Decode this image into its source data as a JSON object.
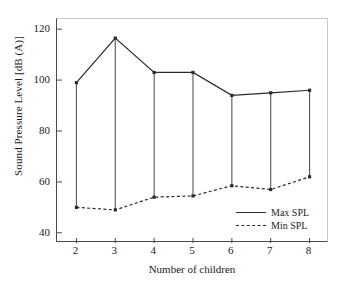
{
  "chart_data": {
    "type": "line",
    "title": "",
    "xlabel": "Number of children",
    "ylabel": "Sound Pressure Level [dB (A)]",
    "x": [
      2,
      3,
      4,
      5,
      6,
      7,
      8
    ],
    "xtick_labels": [
      "2",
      "3",
      "4",
      "5",
      "6",
      "7",
      "8"
    ],
    "ytick_labels": [
      "40",
      "60",
      "80",
      "100",
      "120"
    ],
    "yticks": [
      40,
      60,
      80,
      100,
      120
    ],
    "xlim": [
      1.5,
      8.5
    ],
    "ylim": [
      36,
      124
    ],
    "grid": false,
    "legend_position": "lower-right",
    "series": [
      {
        "name": "Max SPL",
        "style": "solid",
        "color": "#2b2b2b",
        "values": [
          99,
          116.5,
          103,
          103,
          94,
          95,
          96
        ]
      },
      {
        "name": "Min SPL",
        "style": "dashed",
        "color": "#2b2b2b",
        "values": [
          50,
          49,
          54,
          54.5,
          58.5,
          57,
          62
        ]
      }
    ],
    "connectors": {
      "description": "vertical range bars joining Min SPL to Max SPL at each x",
      "color": "#555555"
    }
  },
  "legend": {
    "items": [
      {
        "label": "Max SPL",
        "style": "solid"
      },
      {
        "label": "Min SPL",
        "style": "dashed"
      }
    ]
  }
}
